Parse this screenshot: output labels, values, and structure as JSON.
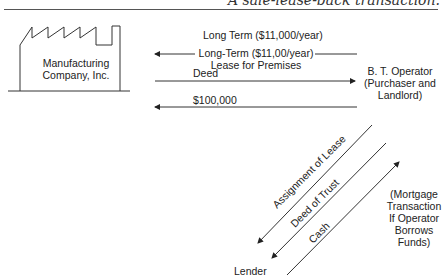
{
  "caption": "A sale-lease-back transaction.",
  "factory": {
    "line1": "Manufacturing",
    "line2": "Company, Inc."
  },
  "operator": {
    "line1": "B. T. Operator",
    "line2": "(Purchaser and",
    "line3": "Landlord)"
  },
  "arrows": {
    "long_term": "Long Term ($11,000/year)",
    "lease_line1": "Long-Term ($11,00/year)",
    "lease_line2": "Lease for Premises",
    "deed": "Deed",
    "cash_100k": "$100,000"
  },
  "diagonals": {
    "assignment": "Assignment of Lease",
    "deed_of_trust": "Deed of Trust",
    "cash": "Cash"
  },
  "lender": "Lender",
  "mortgage_note": {
    "l1": "(Mortgage",
    "l2": "Transaction",
    "l3": "If Operator",
    "l4": "Borrows",
    "l5": "Funds)"
  }
}
